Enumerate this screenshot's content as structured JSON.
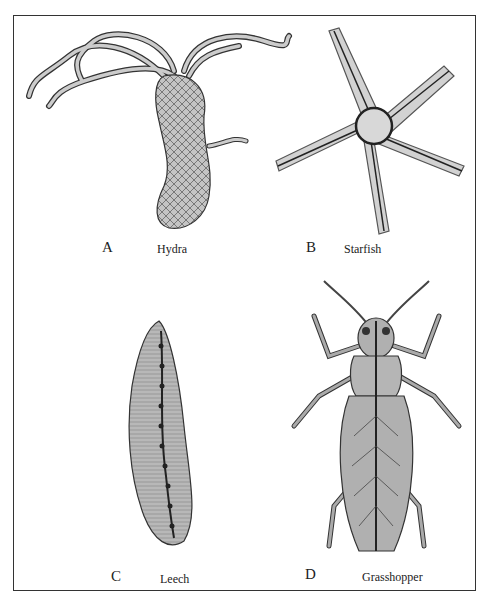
{
  "figure": {
    "panels": [
      {
        "letter": "A",
        "name": "Hydra"
      },
      {
        "letter": "B",
        "name": "Starfish"
      },
      {
        "letter": "C",
        "name": "Leech"
      },
      {
        "letter": "D",
        "name": "Grasshopper"
      }
    ]
  },
  "colors": {
    "frame": "#333333",
    "body_fill": "#bdbdbd",
    "outline": "#333333"
  }
}
